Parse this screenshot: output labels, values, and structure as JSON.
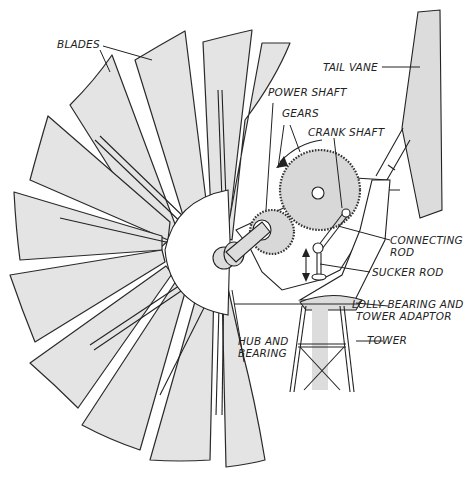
{
  "diagram": {
    "background_color": "#ffffff",
    "blade_fill_color": "#e4e4e4",
    "line_color": "#222222",
    "labels": {
      "blades": "BLADES",
      "tail_vane": "TAIL VANE",
      "power_shaft": "POWER SHAFT",
      "gears": "GEARS",
      "crank_shaft": "CRANK SHAFT",
      "connecting_rod_line1": "CONNECTING",
      "connecting_rod_line2": "ROD",
      "sucker_rod": "SUCKER ROD",
      "lolly_bearing_line1": "LOLLY BEARING AND",
      "lolly_bearing_line2": "TOWER ADAPTOR",
      "hub_and_bearing_line1": "HUB AND",
      "hub_and_bearing_line2": "BEARING",
      "tower": "TOWER"
    }
  }
}
